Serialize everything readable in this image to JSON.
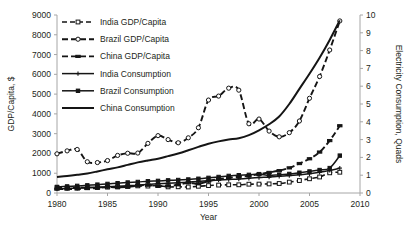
{
  "chart_data": {
    "type": "line",
    "title": "",
    "xlabel": "Year",
    "ylabel": "GDP/Capita, $",
    "y2label": "Electricity Consumption, Quads",
    "xlim": [
      1980,
      2010
    ],
    "ylim": [
      0,
      9000
    ],
    "y2lim": [
      0,
      10
    ],
    "xticks": [
      1980,
      1985,
      1990,
      1995,
      2000,
      2005,
      2010
    ],
    "yticks": [
      0,
      1000,
      2000,
      3000,
      4000,
      5000,
      6000,
      7000,
      8000,
      9000
    ],
    "y2ticks": [
      0,
      1,
      2,
      3,
      4,
      5,
      6,
      7,
      8,
      9,
      10
    ],
    "grid": false,
    "legend_position": "upper-left-inside",
    "x": [
      1980,
      1981,
      1982,
      1983,
      1984,
      1985,
      1986,
      1987,
      1988,
      1989,
      1990,
      1991,
      1992,
      1993,
      1994,
      1995,
      1996,
      1997,
      1998,
      1999,
      2000,
      2001,
      2002,
      2003,
      2004,
      2005,
      2006,
      2007,
      2008
    ],
    "series": [
      {
        "name": "India GDP/Capita",
        "axis": "left",
        "style": "dashed",
        "marker": "open-square",
        "units": "$ per capita",
        "values": [
          270,
          262,
          265,
          282,
          276,
          295,
          305,
          330,
          360,
          350,
          375,
          310,
          315,
          305,
          340,
          375,
          400,
          415,
          415,
          445,
          450,
          460,
          480,
          550,
          630,
          720,
          810,
          1020,
          1050
        ]
      },
      {
        "name": "Brazil GDP/Capita",
        "axis": "left",
        "style": "dashed",
        "marker": "open-circle",
        "units": "$ per capita",
        "values": [
          1980,
          2130,
          2200,
          1580,
          1540,
          1640,
          1900,
          2010,
          2020,
          2510,
          2900,
          2700,
          2540,
          2790,
          3300,
          4700,
          4900,
          5300,
          5200,
          3500,
          3740,
          3130,
          2840,
          3050,
          3640,
          4790,
          5890,
          7230,
          8700
        ]
      },
      {
        "name": "China GDP/Capita",
        "axis": "left",
        "style": "dashed",
        "marker": "small-dash",
        "units": "$ per capita",
        "values": [
          195,
          200,
          205,
          225,
          255,
          295,
          290,
          305,
          370,
          400,
          345,
          355,
          415,
          520,
          465,
          600,
          700,
          770,
          820,
          865,
          950,
          1040,
          1130,
          1270,
          1490,
          1730,
          2070,
          2650,
          3400
        ]
      },
      {
        "name": "India Consumption",
        "axis": "right",
        "style": "solid",
        "marker": "plus",
        "units": "Quads",
        "values": [
          0.23,
          0.25,
          0.27,
          0.29,
          0.32,
          0.35,
          0.38,
          0.41,
          0.44,
          0.48,
          0.52,
          0.55,
          0.58,
          0.61,
          0.65,
          0.69,
          0.73,
          0.76,
          0.79,
          0.83,
          0.87,
          0.9,
          0.94,
          0.98,
          1.03,
          1.08,
          1.16,
          1.27,
          1.4
        ]
      },
      {
        "name": "Brazil Consumption",
        "axis": "right",
        "style": "solid",
        "marker": "square",
        "units": "Quads",
        "values": [
          0.34,
          0.37,
          0.4,
          0.43,
          0.47,
          0.51,
          0.55,
          0.59,
          0.62,
          0.66,
          0.68,
          0.71,
          0.73,
          0.76,
          0.8,
          0.85,
          0.9,
          0.96,
          1.0,
          1.02,
          1.06,
          0.98,
          1.03,
          1.07,
          1.14,
          1.21,
          1.29,
          1.4,
          2.1
        ]
      },
      {
        "name": "China Consumption",
        "axis": "right",
        "style": "solid",
        "marker": "none",
        "units": "Quads",
        "values": [
          0.9,
          0.95,
          1.02,
          1.1,
          1.21,
          1.33,
          1.44,
          1.58,
          1.72,
          1.83,
          1.93,
          2.07,
          2.22,
          2.4,
          2.59,
          2.77,
          2.9,
          3.0,
          3.08,
          3.25,
          3.52,
          3.86,
          4.3,
          5.0,
          5.85,
          6.7,
          7.6,
          8.6,
          9.7
        ]
      }
    ]
  },
  "axes": {
    "left_title": "GDP/Capita, $",
    "right_title": "Electricity Consumption, Quads",
    "x_title": "Year"
  },
  "legend": {
    "items": [
      {
        "label": "India GDP/Capita",
        "style": "dashed",
        "marker": "open-square"
      },
      {
        "label": "Brazil GDP/Capita",
        "style": "dashed",
        "marker": "open-circle"
      },
      {
        "label": "China GDP/Capita",
        "style": "dashed",
        "marker": "small-dash"
      },
      {
        "label": "India Consumption",
        "style": "solid",
        "marker": "plus"
      },
      {
        "label": "Brazil Consumption",
        "style": "solid",
        "marker": "square"
      },
      {
        "label": "China Consumption",
        "style": "solid",
        "marker": "none"
      }
    ]
  },
  "colors": {
    "ink": "#151515",
    "axis": "#a6a6a6",
    "background": "#ffffff"
  }
}
